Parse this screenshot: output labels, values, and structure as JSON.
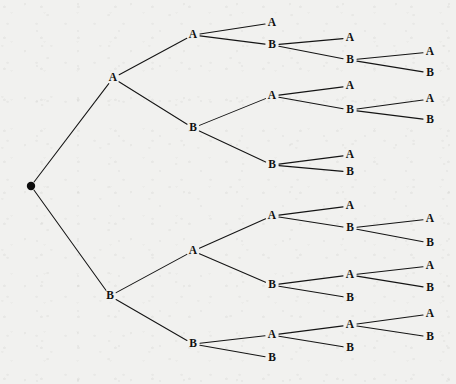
{
  "diagram": {
    "type": "tree",
    "background_color": "#f1f1ef",
    "ink_color": "#141414",
    "root": {
      "name": "root",
      "label": "",
      "marker": "filled-dot",
      "x": 31,
      "y": 186
    },
    "nodes": [
      {
        "id": "A",
        "label": "A",
        "x": 113,
        "y": 78
      },
      {
        "id": "B",
        "label": "B",
        "x": 110,
        "y": 296
      },
      {
        "id": "AA",
        "label": "A",
        "x": 193,
        "y": 35
      },
      {
        "id": "AB",
        "label": "B",
        "x": 193,
        "y": 128
      },
      {
        "id": "BA",
        "label": "A",
        "x": 193,
        "y": 251
      },
      {
        "id": "BB",
        "label": "B",
        "x": 193,
        "y": 344
      },
      {
        "id": "AAA",
        "label": "A",
        "x": 272,
        "y": 23
      },
      {
        "id": "AAB",
        "label": "B",
        "x": 272,
        "y": 45
      },
      {
        "id": "ABA",
        "label": "A",
        "x": 272,
        "y": 96
      },
      {
        "id": "ABB",
        "label": "B",
        "x": 272,
        "y": 165
      },
      {
        "id": "BAA",
        "label": "A",
        "x": 272,
        "y": 216
      },
      {
        "id": "BAB",
        "label": "B",
        "x": 272,
        "y": 285
      },
      {
        "id": "BBA",
        "label": "A",
        "x": 272,
        "y": 335
      },
      {
        "id": "BBB",
        "label": "B",
        "x": 272,
        "y": 358
      },
      {
        "id": "AABA",
        "label": "A",
        "x": 350,
        "y": 38
      },
      {
        "id": "AABB",
        "label": "B",
        "x": 350,
        "y": 60
      },
      {
        "id": "ABAA",
        "label": "A",
        "x": 350,
        "y": 86
      },
      {
        "id": "ABAB",
        "label": "B",
        "x": 350,
        "y": 110
      },
      {
        "id": "ABBA",
        "label": "A",
        "x": 350,
        "y": 155
      },
      {
        "id": "ABBB",
        "label": "B",
        "x": 350,
        "y": 172
      },
      {
        "id": "BAAA",
        "label": "A",
        "x": 350,
        "y": 206
      },
      {
        "id": "BAAB",
        "label": "B",
        "x": 350,
        "y": 228
      },
      {
        "id": "BABA",
        "label": "A",
        "x": 350,
        "y": 275
      },
      {
        "id": "BABB",
        "label": "B",
        "x": 350,
        "y": 298
      },
      {
        "id": "BBAA",
        "label": "A",
        "x": 350,
        "y": 325
      },
      {
        "id": "BBAB",
        "label": "B",
        "x": 350,
        "y": 348
      },
      {
        "id": "AABBA",
        "label": "A",
        "x": 430,
        "y": 52
      },
      {
        "id": "AABBB",
        "label": "B",
        "x": 430,
        "y": 73
      },
      {
        "id": "ABABA",
        "label": "A",
        "x": 430,
        "y": 99
      },
      {
        "id": "ABABB",
        "label": "B",
        "x": 430,
        "y": 120
      },
      {
        "id": "BAABA",
        "label": "A",
        "x": 430,
        "y": 219
      },
      {
        "id": "BAABB",
        "label": "B",
        "x": 430,
        "y": 243
      },
      {
        "id": "BABAA",
        "label": "A",
        "x": 430,
        "y": 266
      },
      {
        "id": "BABAB",
        "label": "B",
        "x": 430,
        "y": 288
      },
      {
        "id": "BBAAA",
        "label": "A",
        "x": 430,
        "y": 314
      },
      {
        "id": "BBAAB",
        "label": "B",
        "x": 430,
        "y": 337
      }
    ],
    "edges": [
      {
        "from": "root",
        "to": "A"
      },
      {
        "from": "root",
        "to": "B"
      },
      {
        "from": "A",
        "to": "AA"
      },
      {
        "from": "A",
        "to": "AB"
      },
      {
        "from": "B",
        "to": "BA"
      },
      {
        "from": "B",
        "to": "BB"
      },
      {
        "from": "AA",
        "to": "AAA"
      },
      {
        "from": "AA",
        "to": "AAB"
      },
      {
        "from": "AB",
        "to": "ABA"
      },
      {
        "from": "AB",
        "to": "ABB"
      },
      {
        "from": "BA",
        "to": "BAA"
      },
      {
        "from": "BA",
        "to": "BAB"
      },
      {
        "from": "BB",
        "to": "BBA"
      },
      {
        "from": "BB",
        "to": "BBB"
      },
      {
        "from": "AAB",
        "to": "AABA"
      },
      {
        "from": "AAB",
        "to": "AABB"
      },
      {
        "from": "ABA",
        "to": "ABAA"
      },
      {
        "from": "ABA",
        "to": "ABAB"
      },
      {
        "from": "ABB",
        "to": "ABBA"
      },
      {
        "from": "ABB",
        "to": "ABBB"
      },
      {
        "from": "BAA",
        "to": "BAAA"
      },
      {
        "from": "BAA",
        "to": "BAAB"
      },
      {
        "from": "BAB",
        "to": "BABA"
      },
      {
        "from": "BAB",
        "to": "BABB"
      },
      {
        "from": "BBA",
        "to": "BBAA"
      },
      {
        "from": "BBA",
        "to": "BBAB"
      },
      {
        "from": "AABB",
        "to": "AABBA"
      },
      {
        "from": "AABB",
        "to": "AABBB"
      },
      {
        "from": "ABAB",
        "to": "ABABA"
      },
      {
        "from": "ABAB",
        "to": "ABABB"
      },
      {
        "from": "BAAB",
        "to": "BAABA"
      },
      {
        "from": "BAAB",
        "to": "BAABB"
      },
      {
        "from": "BABA",
        "to": "BABAA"
      },
      {
        "from": "BABA",
        "to": "BABAB"
      },
      {
        "from": "BBAA",
        "to": "BBAAA"
      },
      {
        "from": "BBAA",
        "to": "BBAAB"
      }
    ]
  }
}
